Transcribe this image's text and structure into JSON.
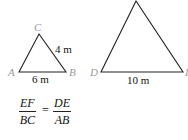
{
  "diagram": {
    "small_triangle": {
      "vertices": {
        "A": "A",
        "B": "B",
        "C": "C"
      },
      "side_labels": {
        "CB": "4 m",
        "AB": "6 m"
      }
    },
    "large_triangle": {
      "vertices": {
        "D": "D",
        "F": "I"
      },
      "side_labels": {
        "DF": "10 m"
      }
    },
    "equation": {
      "left": {
        "numerator": "EF",
        "denominator": "BC"
      },
      "equals": "=",
      "right": {
        "numerator": "DE",
        "denominator": "AB"
      }
    },
    "colors": {
      "line": "#222222",
      "vertex_label": "#9a9a9a",
      "text": "#111111"
    }
  }
}
